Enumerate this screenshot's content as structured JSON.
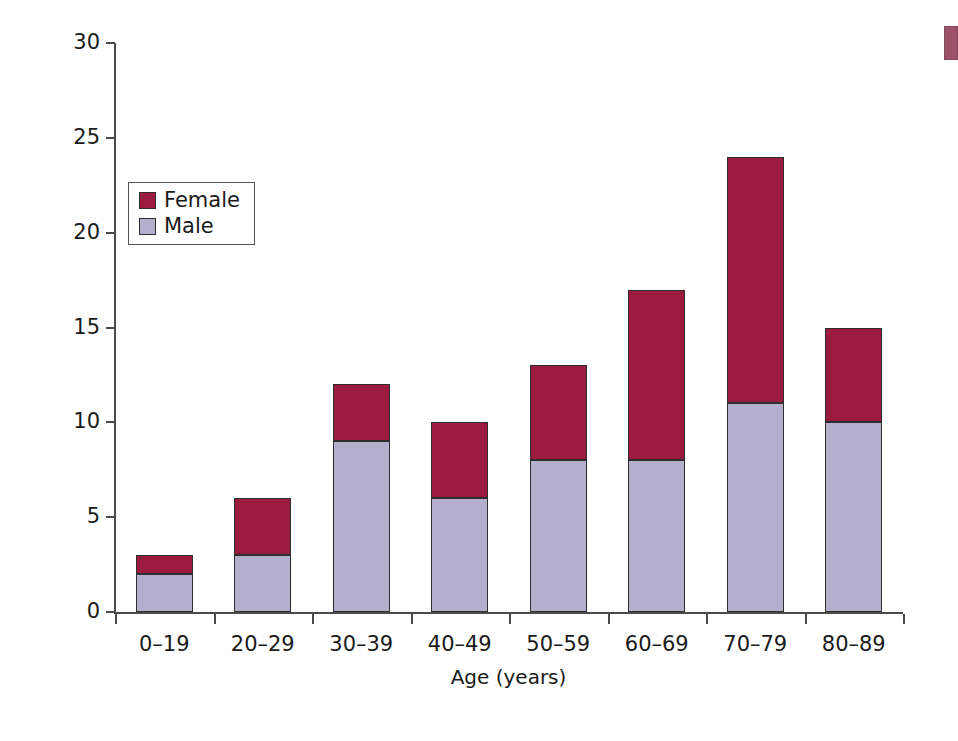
{
  "chart_data": {
    "type": "bar",
    "stacked": true,
    "title": "",
    "xlabel": "Age (years)",
    "ylabel": "Number of patients",
    "categories": [
      "0–19",
      "20–29",
      "30–39",
      "40–49",
      "50–59",
      "60–69",
      "70–79",
      "80–89"
    ],
    "series": [
      {
        "name": "Male",
        "values": [
          2,
          3,
          9,
          6,
          8,
          8,
          11,
          10
        ],
        "color": "#b5afce"
      },
      {
        "name": "Female",
        "values": [
          1,
          3,
          3,
          4,
          5,
          9,
          13,
          5
        ],
        "color": "#9a1b3e"
      }
    ],
    "totals": [
      3,
      6,
      12,
      10,
      13,
      17,
      24,
      15
    ],
    "ylim": [
      0,
      30
    ],
    "yticks": [
      0,
      5,
      10,
      15,
      20,
      25,
      30
    ],
    "ytick_labels": [
      "0",
      "5",
      "10",
      "15",
      "20",
      "25",
      "30"
    ],
    "grid": false,
    "legend_position": "upper left",
    "legend_entries": [
      {
        "label": "Female",
        "color": "#9a1b3e"
      },
      {
        "label": "Male",
        "color": "#b5afce"
      }
    ]
  },
  "axes": {
    "y_title": "Number of patients",
    "x_title": "Age (years)"
  },
  "legend": {
    "entries": [
      {
        "label": "Female"
      },
      {
        "label": "Male"
      }
    ]
  },
  "colors": {
    "female": "#9a1b3e",
    "male": "#b5afce",
    "axis": "#4a4a4a",
    "bar_outline": "#2e2e2e",
    "background": "#ffffff"
  }
}
